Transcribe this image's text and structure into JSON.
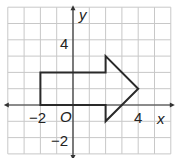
{
  "diagram": {
    "type": "coordinate-plane",
    "origin_label": "O",
    "x_axis_label": "x",
    "y_axis_label": "y",
    "grid": {
      "x_min": -4,
      "x_max": 6,
      "y_min": -3,
      "y_max": 6,
      "cell_px": 16.3,
      "origin_px": [
        73,
        105
      ]
    },
    "tick_labels": {
      "x": [
        {
          "value": -2,
          "text": "−2"
        },
        {
          "value": 4,
          "text": "4"
        }
      ],
      "y": [
        {
          "value": 4,
          "text": "4"
        },
        {
          "value": -2,
          "text": "−2"
        }
      ]
    },
    "shape": {
      "name": "arrow",
      "vertices": [
        [
          -2,
          0
        ],
        [
          -2,
          2
        ],
        [
          2,
          2
        ],
        [
          2,
          3
        ],
        [
          4,
          1
        ],
        [
          2,
          -1
        ],
        [
          2,
          0
        ]
      ]
    },
    "colors": {
      "grid": "#c8c8c8",
      "axis": "#333333",
      "shape": "#2a2a2a"
    }
  }
}
